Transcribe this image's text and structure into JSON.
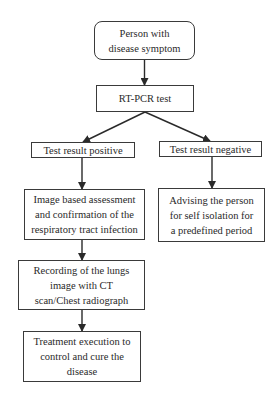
{
  "diagram": {
    "type": "flowchart",
    "colors": {
      "stroke": "#3a3a3a",
      "text": "#2a2a2a",
      "background": "#ffffff"
    },
    "nodes": {
      "start": {
        "label": "Person with disease symptom",
        "lines": [
          "Person with",
          "disease symptom"
        ],
        "shape": "rounded-rect"
      },
      "rtpcr": {
        "label": "RT-PCR test",
        "lines": [
          "RT-PCR test"
        ],
        "shape": "rect"
      },
      "positive": {
        "label": "Test result positive",
        "lines": [
          "Test result positive"
        ],
        "shape": "rect"
      },
      "negative": {
        "label": "Test result negative",
        "lines": [
          "Test result negative"
        ],
        "shape": "rect"
      },
      "assessment": {
        "label": "Image based assessment and confirmation of the respiratory tract infection",
        "lines": [
          "Image based assessment",
          "and confirmation of the",
          "respiratory tract infection"
        ],
        "shape": "rect"
      },
      "isolation": {
        "label": "Advising the person for self isolation for a predefined period",
        "lines": [
          "Advising the person",
          "for self isolation for",
          "a predefined period"
        ],
        "shape": "rect"
      },
      "recording": {
        "label": "Recording of the lungs image with CT scan/Chest radiograph",
        "lines": [
          "Recording of the lungs",
          "image with CT",
          "scan/Chest radiograph"
        ],
        "shape": "rect"
      },
      "treatment": {
        "label": "Treatment execution to control and cure the disease",
        "lines": [
          "Treatment execution to",
          "control and cure the",
          "disease"
        ],
        "shape": "rect"
      }
    },
    "edges": [
      {
        "from": "start",
        "to": "rtpcr"
      },
      {
        "from": "rtpcr",
        "to": "positive"
      },
      {
        "from": "rtpcr",
        "to": "negative"
      },
      {
        "from": "positive",
        "to": "assessment"
      },
      {
        "from": "negative",
        "to": "isolation"
      },
      {
        "from": "assessment",
        "to": "recording"
      },
      {
        "from": "recording",
        "to": "treatment"
      }
    ]
  }
}
